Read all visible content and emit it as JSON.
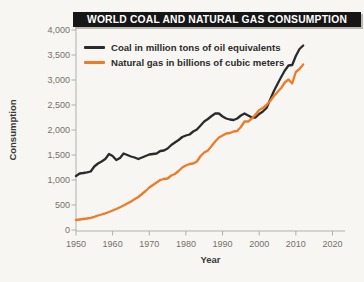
{
  "title": "WORLD COAL AND NATURAL GAS CONSUMPTION",
  "colors": {
    "background": "#f7f6f2",
    "title_bg": "#161616",
    "title_text": "#ffffff",
    "coal_line": "#2b2b2b",
    "gas_line": "#ee7b28",
    "axis": "#b3b0aa",
    "tick_label": "#74716b"
  },
  "legend": {
    "items": [
      {
        "label": "Coal in million tons of oil equivalents"
      },
      {
        "label": "Natural gas in billions of cubic meters"
      }
    ]
  },
  "axes": {
    "y_label": "Consumption",
    "x_label": "Year"
  },
  "chart_data": {
    "type": "line",
    "title": "WORLD COAL AND NATURAL GAS CONSUMPTION",
    "xlabel": "Year",
    "ylabel": "Consumption",
    "xlim": [
      1948,
      2023
    ],
    "ylim": [
      0,
      4000
    ],
    "grid": false,
    "legend_position": "top-left",
    "x_tick_values": [
      1950,
      1960,
      1970,
      1980,
      1990,
      2000,
      2010,
      2020
    ],
    "x_tick_labels": [
      "1950",
      "1960",
      "1970",
      "1980",
      "1990",
      "2000",
      "2010",
      "2020"
    ],
    "y_tick_values": [
      0,
      500,
      1000,
      1500,
      2000,
      2500,
      3000,
      3500,
      4000
    ],
    "y_tick_labels": [
      "0",
      "500",
      "1,000",
      "1,500",
      "2,000",
      "2,500",
      "3,000",
      "3,500",
      "4,000"
    ],
    "x": [
      1950,
      1951,
      1952,
      1953,
      1954,
      1955,
      1956,
      1957,
      1958,
      1959,
      1960,
      1961,
      1962,
      1963,
      1964,
      1965,
      1966,
      1967,
      1968,
      1969,
      1970,
      1971,
      1972,
      1973,
      1974,
      1975,
      1976,
      1977,
      1978,
      1979,
      1980,
      1981,
      1982,
      1983,
      1984,
      1985,
      1986,
      1987,
      1988,
      1989,
      1990,
      1991,
      1992,
      1993,
      1994,
      1995,
      1996,
      1997,
      1998,
      1999,
      2000,
      2001,
      2002,
      2003,
      2004,
      2005,
      2006,
      2007,
      2008,
      2009,
      2010,
      2011,
      2012
    ],
    "series": [
      {
        "name": "Coal in million tons of oil equivalents",
        "unit": "million tons of oil equivalents",
        "color": "#2b2b2b",
        "data_name": "coal-line",
        "values": [
          1080,
          1130,
          1140,
          1155,
          1170,
          1270,
          1330,
          1370,
          1420,
          1520,
          1480,
          1400,
          1440,
          1530,
          1500,
          1470,
          1450,
          1420,
          1450,
          1480,
          1510,
          1520,
          1530,
          1580,
          1590,
          1630,
          1700,
          1750,
          1800,
          1860,
          1890,
          1910,
          1970,
          2010,
          2090,
          2170,
          2220,
          2280,
          2330,
          2330,
          2270,
          2230,
          2210,
          2200,
          2230,
          2290,
          2330,
          2290,
          2250,
          2250,
          2320,
          2370,
          2440,
          2610,
          2780,
          2920,
          3060,
          3190,
          3290,
          3300,
          3480,
          3620,
          3690
        ]
      },
      {
        "name": "Natural gas in billions of cubic meters",
        "unit": "billions of cubic meters",
        "color": "#ee7b28",
        "data_name": "gas-line",
        "values": [
          200,
          210,
          220,
          230,
          245,
          265,
          290,
          310,
          335,
          360,
          390,
          420,
          455,
          490,
          530,
          570,
          615,
          660,
          720,
          780,
          850,
          900,
          950,
          1000,
          1020,
          1030,
          1090,
          1120,
          1180,
          1250,
          1290,
          1320,
          1330,
          1370,
          1480,
          1550,
          1590,
          1680,
          1770,
          1850,
          1890,
          1930,
          1940,
          1970,
          1980,
          2060,
          2170,
          2170,
          2230,
          2310,
          2400,
          2440,
          2500,
          2580,
          2680,
          2760,
          2840,
          2950,
          3010,
          2930,
          3160,
          3220,
          3310
        ]
      }
    ]
  }
}
